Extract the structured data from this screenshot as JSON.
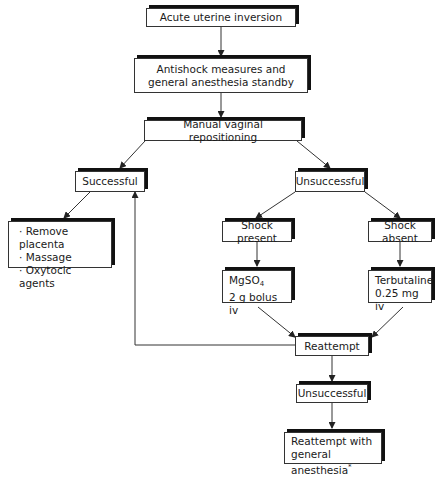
{
  "nodes": {
    "start": "Acute uterine inversion",
    "antishock_line1": "Antishock measures and",
    "antishock_line2": "general anesthesia standby",
    "manual": "Manual vaginal repositioning",
    "successful": "Successful",
    "unsuccessful": "Unsuccessful",
    "success_actions": [
      "· Remove placenta",
      "· Massage",
      "· Oxytocic agents"
    ],
    "shock_present": "Shock present",
    "shock_absent": "Shock absent",
    "mgso4_base": "MgSO",
    "mgso4_sub": "4",
    "mgso4_dose": "2 g bolus iv",
    "terbutaline_line1": "Terbutaline",
    "terbutaline_line2": "0.25 mg iv",
    "reattempt": "Reattempt",
    "unsuccessful2": "Unsuccessful",
    "final_line1": "Reattempt with",
    "final_line2": "general anesthesia",
    "final_footnote": "*"
  }
}
